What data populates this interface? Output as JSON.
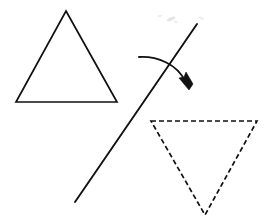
{
  "canvas": {
    "width": 267,
    "height": 224,
    "background_color": "#ffffff",
    "ink_color": "#111111",
    "description": "Geometry diagram showing a triangle reflected across a slanted line"
  },
  "figure": {
    "title": "Reflection of a triangle across a slanted mirror line",
    "stroke_color": "#111111",
    "stroke_width": 1.7
  },
  "shapes": {
    "preimage_triangle": {
      "label": "original triangle",
      "style": "solid",
      "closed": true,
      "points": [
        [
          66,
          11
        ],
        [
          117,
          102
        ],
        [
          16,
          102
        ]
      ],
      "path": "M 66 11 L 117 102 L 16 102 Z",
      "orientation": "point-up"
    },
    "image_triangle": {
      "label": "reflected triangle",
      "style": "dashed",
      "dash_pattern": "5 3",
      "closed": true,
      "points": [
        [
          151,
          121
        ],
        [
          257,
          121
        ],
        [
          205,
          215
        ]
      ],
      "path": "M 151 121 L 257 121 L 205 215 Z",
      "orientation": "point-down"
    },
    "mirror_line": {
      "label": "line of reflection",
      "style": "solid",
      "start": [
        197,
        24
      ],
      "end": [
        75,
        202
      ],
      "path": "M 197 24 L 75 202"
    },
    "rotation_arrow": {
      "label": "flip direction arrow",
      "style": "solid curved with arrowhead",
      "tail": [
        139,
        57
      ],
      "tip": [
        189,
        88
      ],
      "curve_path": "M 139 57 C 157 56 177 64 185 81",
      "head_path": "M 189 90 L 179 78 L 184 77 L 186 72 L 193 84 Z"
    }
  },
  "artifacts": {
    "scan_smudges": [
      {
        "cx": 171,
        "cy": 19,
        "rx": 4.5,
        "ry": 1.6,
        "rotate": -22
      },
      {
        "cx": 176,
        "cy": 22,
        "rx": 2.2,
        "ry": 1.1,
        "rotate": 15
      },
      {
        "cx": 160,
        "cy": 16,
        "rx": 2.6,
        "ry": 1.0,
        "rotate": -10
      },
      {
        "cx": 201,
        "cy": 18,
        "rx": 3.0,
        "ry": 1.2,
        "rotate": 20
      }
    ]
  }
}
